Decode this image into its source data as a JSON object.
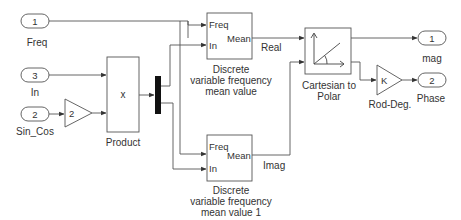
{
  "inports": [
    {
      "number": "1",
      "name": "Freq"
    },
    {
      "number": "3",
      "name": "In"
    },
    {
      "number": "2",
      "name": "Sin_Cos"
    }
  ],
  "gain_input": {
    "value": "2"
  },
  "product": {
    "symbol": "x",
    "name": "Product"
  },
  "mean_real": {
    "in_ports": [
      "Freq",
      "In"
    ],
    "out_port": "Mean",
    "name_lines": [
      "Discrete",
      "variable frequency",
      "mean value"
    ]
  },
  "mean_imag": {
    "in_ports": [
      "Freq",
      "In"
    ],
    "out_port": "Mean",
    "name_lines": [
      "Discrete",
      "variable frequency",
      "mean value 1"
    ]
  },
  "signals": {
    "real": "Real",
    "imag": "Imag"
  },
  "cart2polar": {
    "name_lines": [
      "Cartesian to",
      "Polar"
    ]
  },
  "rad_deg": {
    "value": "K",
    "name": "Rod-Deg."
  },
  "outports": [
    {
      "number": "1",
      "name": "mag"
    },
    {
      "number": "2",
      "name": "Phase"
    }
  ],
  "colors": {
    "line": "#444444",
    "bus": "#111111"
  }
}
